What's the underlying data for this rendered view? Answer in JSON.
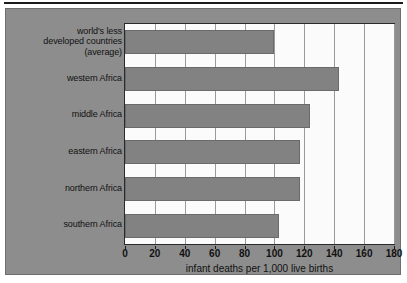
{
  "chart_data": {
    "type": "bar",
    "orientation": "horizontal",
    "title": "",
    "xlabel": "infant deaths per 1,000 live births",
    "ylabel": "",
    "xlim": [
      0,
      180
    ],
    "xticks": [
      0,
      20,
      40,
      60,
      80,
      100,
      120,
      140,
      160,
      180
    ],
    "grid": "vertical",
    "legend": "none",
    "categories": [
      "world's less developed countries (average)",
      "western Africa",
      "middle Africa",
      "eastern Africa",
      "northern Africa",
      "southern Africa"
    ],
    "category_label_lines": [
      [
        "world's less",
        "developed countries",
        "(average)"
      ],
      [
        "western Africa"
      ],
      [
        "middle Africa"
      ],
      [
        "eastern Africa"
      ],
      [
        "northern Africa"
      ],
      [
        "southern Africa"
      ]
    ],
    "values": [
      100,
      143,
      124,
      117,
      117,
      103
    ],
    "value_unit": "infant deaths per 1,000 live births"
  },
  "colors": {
    "panel_background": "#8d8d8d",
    "plot_background": "#fbfbfb",
    "bar_fill": "#828282",
    "bar_edge": "#6a6a6a",
    "gridline": "#9a9a9a",
    "axis": "#2a2a2a",
    "text": "#111111",
    "top_rule": "#1c1c1c"
  },
  "axis": {
    "tick_labels": [
      "0",
      "20",
      "40",
      "60",
      "80",
      "100",
      "120",
      "140",
      "160",
      "180"
    ],
    "title": "infant deaths per 1,000 live births"
  }
}
